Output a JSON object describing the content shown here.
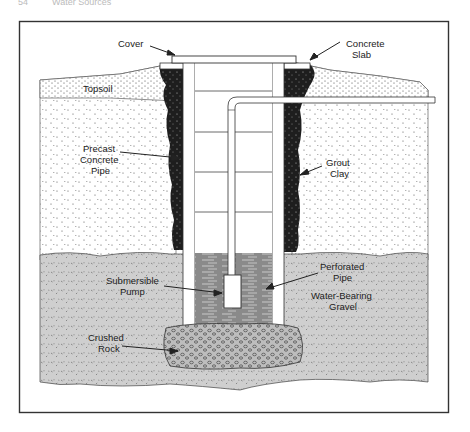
{
  "page_header": {
    "page_number": "54",
    "running_title": "Water Sources"
  },
  "diagram": {
    "labels": {
      "cover": "Cover",
      "concrete_slab_1": "Concrete",
      "concrete_slab_2": "Slab",
      "topsoil": "Topsoil",
      "precast_1": "Precast",
      "precast_2": "Concrete",
      "precast_3": "Pipe",
      "grout_1": "Grout",
      "grout_2": "Clay",
      "submersible_1": "Submersible",
      "submersible_2": "Pump",
      "perforated_1": "Perforated",
      "perforated_2": "Pipe",
      "water_bearing_1": "Water-Bearing",
      "water_bearing_2": "Gravel",
      "crushed_1": "Crushed",
      "crushed_2": "Rock"
    },
    "colors": {
      "frame": "#333333",
      "grout": "#1e1e1e",
      "gravel": "#cfcfcf",
      "water": "#8a8a8a",
      "soil": "#ffffff",
      "rock": "#bdbdbd"
    }
  }
}
